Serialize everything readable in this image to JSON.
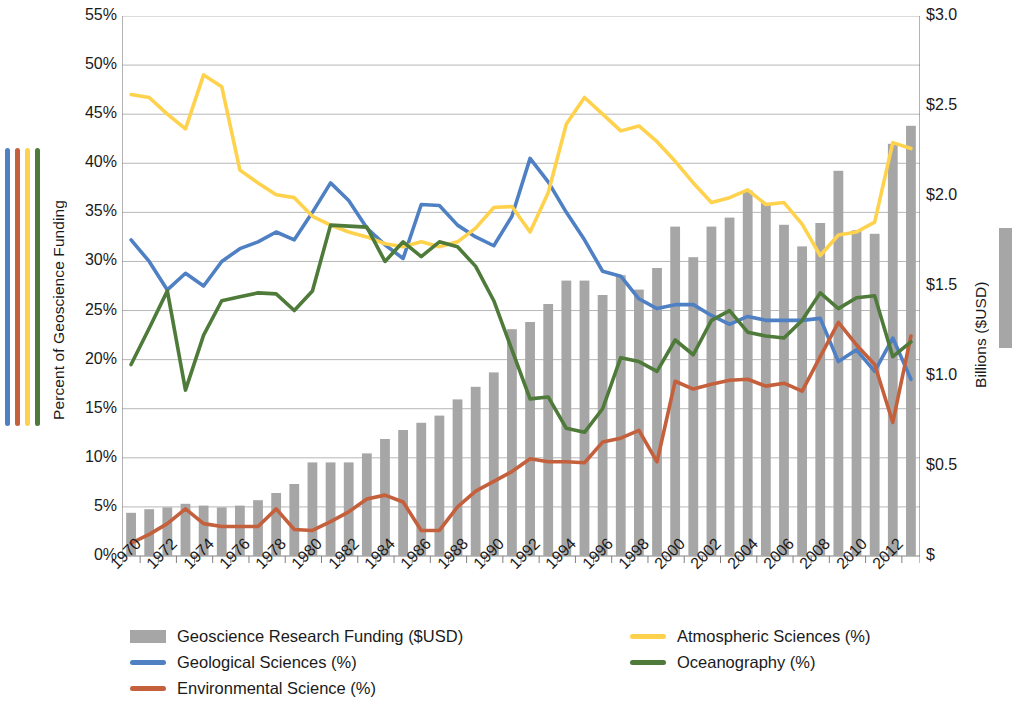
{
  "chart_data": {
    "type": "bar",
    "title": "",
    "subtitle": "",
    "ylabel": "Percent of Geoscience Funding",
    "ylabel_secondary": "Billions ($USD)",
    "xlabel": "",
    "grid": true,
    "legend_position": "bottom",
    "ylim": [
      0,
      55
    ],
    "ylim_secondary": [
      0,
      3.0
    ],
    "xlim": [
      1970,
      2013
    ],
    "yticks": [
      "0%",
      "5%",
      "10%",
      "15%",
      "20%",
      "25%",
      "30%",
      "35%",
      "40%",
      "45%",
      "50%",
      "55%"
    ],
    "yticks_secondary": [
      "$",
      "$0.5",
      "$1.0",
      "$1.5",
      "$2.0",
      "$2.5",
      "$3.0"
    ],
    "x": [
      1970,
      1971,
      1972,
      1973,
      1974,
      1975,
      1976,
      1977,
      1978,
      1979,
      1980,
      1981,
      1982,
      1983,
      1984,
      1985,
      1986,
      1987,
      1988,
      1989,
      1990,
      1991,
      1992,
      1993,
      1994,
      1995,
      1996,
      1997,
      1998,
      1999,
      2000,
      2001,
      2002,
      2003,
      2004,
      2005,
      2006,
      2007,
      2008,
      2009,
      2010,
      2011,
      2012,
      2013
    ],
    "xticklabels": [
      "1970",
      "1972",
      "1974",
      "1976",
      "1978",
      "1980",
      "1982",
      "1984",
      "1986",
      "1988",
      "1990",
      "1992",
      "1994",
      "1996",
      "1998",
      "2000",
      "2002",
      "2004",
      "2006",
      "2008",
      "2010",
      "2012"
    ],
    "series": [
      {
        "name": "Geoscience Research Funding ($USD)",
        "type": "bar",
        "axis": "secondary",
        "unit": "Billions ($USD)",
        "color": "#a6a6a6",
        "values": [
          0.24,
          0.26,
          0.27,
          0.29,
          0.28,
          0.27,
          0.28,
          0.31,
          0.35,
          0.4,
          0.52,
          0.52,
          0.52,
          0.57,
          0.65,
          0.7,
          0.74,
          0.78,
          0.87,
          0.94,
          1.02,
          1.26,
          1.3,
          1.4,
          1.53,
          1.53,
          1.45,
          1.56,
          1.48,
          1.6,
          1.83,
          1.66,
          1.83,
          1.88,
          2.03,
          1.96,
          1.84,
          1.72,
          1.85,
          2.14,
          1.81,
          1.79,
          2.29,
          2.39
        ]
      },
      {
        "name": "Geological Sciences (%)",
        "type": "line",
        "axis": "primary",
        "color": "#4f80c4",
        "values": [
          32.2,
          30.0,
          27.1,
          28.8,
          27.5,
          30.0,
          31.3,
          32.0,
          33.0,
          32.2,
          35.0,
          38.0,
          36.2,
          33.4,
          31.7,
          30.3,
          35.8,
          35.7,
          33.7,
          32.5,
          31.6,
          34.6,
          40.5,
          38.1,
          35.0,
          32.2,
          29.0,
          28.5,
          26.2,
          25.2,
          25.6,
          25.6,
          24.5,
          23.6,
          24.4,
          24.0,
          24.0,
          24.0,
          24.2,
          19.8,
          21.0,
          18.8,
          22.2,
          18.0
        ]
      },
      {
        "name": "Environmental Science (%)",
        "type": "line",
        "axis": "primary",
        "color": "#c5603d",
        "values": [
          1.3,
          2.2,
          3.3,
          4.8,
          3.3,
          3.0,
          3.0,
          3.0,
          4.8,
          2.7,
          2.6,
          3.5,
          4.5,
          5.8,
          6.2,
          5.5,
          2.6,
          2.6,
          5.0,
          6.6,
          7.6,
          8.6,
          9.9,
          9.6,
          9.6,
          9.5,
          11.6,
          12.0,
          12.8,
          9.6,
          17.8,
          17.0,
          17.5,
          17.9,
          18.0,
          17.3,
          17.6,
          16.8,
          20.3,
          23.8,
          21.5,
          19.5,
          13.6,
          22.4
        ]
      },
      {
        "name": "Atmospheric Sciences (%)",
        "type": "line",
        "axis": "primary",
        "color": "#ffd24d",
        "values": [
          47.0,
          46.7,
          45.0,
          43.5,
          49.0,
          47.8,
          39.3,
          38.0,
          36.8,
          36.5,
          34.6,
          33.7,
          33.0,
          32.5,
          31.8,
          31.5,
          32.0,
          31.5,
          32.0,
          33.4,
          35.5,
          35.6,
          33.0,
          37.0,
          44.0,
          46.7,
          45.0,
          43.3,
          43.8,
          42.2,
          40.2,
          38.0,
          36.0,
          36.5,
          37.3,
          35.8,
          36.0,
          33.8,
          30.6,
          32.7,
          33.0,
          34.0,
          42.1,
          41.5
        ]
      },
      {
        "name": "Oceanography (%)",
        "type": "line",
        "axis": "primary",
        "color": "#4e7a3a",
        "values": [
          19.5,
          23.2,
          27.0,
          16.9,
          22.5,
          26.0,
          26.4,
          26.8,
          26.7,
          25.0,
          27.0,
          33.7,
          33.6,
          33.5,
          30.0,
          32.0,
          30.5,
          32.0,
          31.5,
          29.5,
          26.0,
          21.0,
          16.0,
          16.2,
          13.0,
          12.6,
          15.0,
          20.2,
          19.8,
          18.8,
          22.0,
          20.5,
          24.0,
          25.0,
          22.8,
          22.4,
          22.2,
          24.0,
          26.8,
          25.2,
          26.3,
          26.5,
          20.3,
          21.8
        ]
      }
    ]
  },
  "axes": {
    "left_title": "Percent of Geoscience Funding",
    "right_title": "Billions ($USD)"
  },
  "legend": {
    "items": [
      {
        "label": "Geoscience Research Funding ($USD)",
        "color": "#a6a6a6",
        "marker": "bar",
        "col": 0,
        "row": 0
      },
      {
        "label": "Geological Sciences (%)",
        "color": "#4f80c4",
        "marker": "line",
        "col": 0,
        "row": 1
      },
      {
        "label": "Environmental Science (%)",
        "color": "#c5603d",
        "marker": "line",
        "col": 0,
        "row": 2
      },
      {
        "label": "Atmospheric Sciences (%)",
        "color": "#ffd24d",
        "marker": "line",
        "col": 1,
        "row": 0
      },
      {
        "label": "Oceanography (%)",
        "color": "#4e7a3a",
        "marker": "line",
        "col": 1,
        "row": 1
      }
    ]
  },
  "color_strip": [
    "#4f80c4",
    "#c5603d",
    "#ffd24d",
    "#4e7a3a"
  ],
  "colors": {
    "grid": "#b7b7b7",
    "axis": "#808080",
    "text": "#1a1a1a",
    "background": "#ffffff"
  }
}
